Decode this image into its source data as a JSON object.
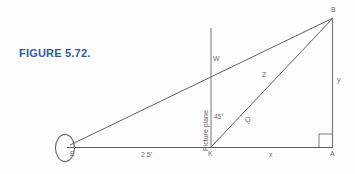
{
  "figure": {
    "title": "FIGURE 5.72.",
    "title_color": "#2f5c9e",
    "line_color": "#5a5a5a",
    "background": "#fdfdfd"
  },
  "points": {
    "eye": "E",
    "station": "K",
    "ground": "A",
    "object_top": "B",
    "plane_point": "W"
  },
  "segments": {
    "eye_to_station": "2.5'",
    "station_to_ground": "x",
    "vertical_height": "y",
    "upper_diagonal": "Z",
    "lower_diagonal": "Q"
  },
  "annotations": {
    "angle": "45°",
    "picture_plane": "Picture plane"
  },
  "icons": {
    "eye_shape": "eye-ellipse-icon",
    "right_angle": "right-angle-marker-icon"
  }
}
